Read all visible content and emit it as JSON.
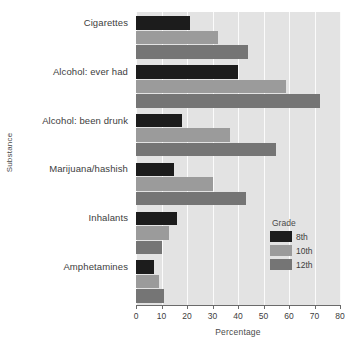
{
  "chart_data": {
    "type": "bar",
    "orientation": "horizontal",
    "title": "",
    "xlabel": "Percentage",
    "ylabel": "Substance",
    "xlim": [
      0,
      80
    ],
    "xticks": [
      0,
      10,
      20,
      30,
      40,
      50,
      60,
      70,
      80
    ],
    "grid": true,
    "grid_axis": "x",
    "legend_title": "Grade",
    "legend_position": "inside-lower-right",
    "categories": [
      "Cigarettes",
      "Alcohol: ever had",
      "Alcohol: been drunk",
      "Marijuana/hashish",
      "Inhalants",
      "Amphetamines"
    ],
    "series": [
      {
        "name": "8th",
        "color": "#1c1c1c",
        "values": [
          21,
          40,
          18,
          15,
          16,
          7
        ]
      },
      {
        "name": "10th",
        "color": "#9b9b9b",
        "values": [
          32,
          59,
          37,
          30,
          13,
          9
        ]
      },
      {
        "name": "12th",
        "color": "#757575",
        "values": [
          44,
          72,
          55,
          43,
          10,
          11
        ]
      }
    ],
    "plot_background": "#e3e3e3",
    "gridline_color": "#fbfbfb",
    "axis_color": "#6a6a6a"
  }
}
